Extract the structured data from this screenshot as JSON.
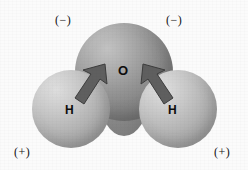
{
  "figure": {
    "background_color": "#fbfbfb"
  },
  "atoms": [
    {
      "id": "oxygen",
      "label": "O",
      "element": "Oxygen",
      "color": "#949494",
      "highlight_color": "#c2c2c2",
      "shadow_color": "#696969"
    },
    {
      "id": "hydrogen-left",
      "label": "H",
      "element": "Hydrogen",
      "color": "#b9b9b9",
      "highlight_color": "#dedede",
      "shadow_color": "#949494"
    },
    {
      "id": "hydrogen-right",
      "label": "H",
      "element": "Hydrogen",
      "color": "#b9b9b9",
      "highlight_color": "#dedede",
      "shadow_color": "#949494"
    }
  ],
  "charges": [
    {
      "id": "top-left",
      "label": "(−)",
      "sign": "negative",
      "position": "top-left"
    },
    {
      "id": "top-right",
      "label": "(−)",
      "sign": "negative",
      "position": "top-right"
    },
    {
      "id": "bottom-left",
      "label": "(+)",
      "sign": "positive",
      "position": "bottom-left"
    },
    {
      "id": "bottom-right",
      "label": "(+)",
      "sign": "positive",
      "position": "bottom-right"
    }
  ],
  "arrows": [
    {
      "id": "left",
      "from": "hydrogen-left",
      "to": "oxygen",
      "direction": "up-right",
      "color": "#5f5f5f"
    },
    {
      "id": "right",
      "from": "hydrogen-right",
      "to": "oxygen",
      "direction": "up-left",
      "color": "#5f5f5f"
    }
  ]
}
